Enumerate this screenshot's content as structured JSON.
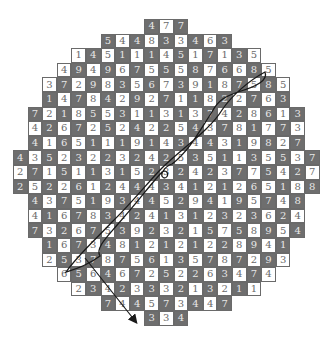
{
  "puzzle": {
    "type": "hexagonal-number-grid-path",
    "rows": [
      [
        4,
        7,
        7
      ],
      [
        5,
        4,
        4,
        8,
        3,
        3,
        4,
        6,
        3
      ],
      [
        1,
        4,
        5,
        1,
        1,
        1,
        4,
        5,
        1,
        7,
        1,
        3,
        5
      ],
      [
        4,
        9,
        4,
        9,
        6,
        7,
        5,
        5,
        5,
        8,
        7,
        6,
        6,
        8,
        5
      ],
      [
        3,
        7,
        2,
        9,
        8,
        3,
        5,
        6,
        7,
        3,
        9,
        1,
        8,
        7,
        5,
        8,
        5
      ],
      [
        1,
        4,
        7,
        8,
        4,
        2,
        9,
        2,
        7,
        1,
        1,
        8,
        2,
        2,
        7,
        6,
        3
      ],
      [
        7,
        2,
        1,
        8,
        5,
        5,
        3,
        1,
        1,
        3,
        1,
        3,
        7,
        4,
        2,
        8,
        6,
        1,
        3
      ],
      [
        4,
        2,
        6,
        7,
        2,
        5,
        2,
        4,
        2,
        2,
        5,
        4,
        3,
        7,
        8,
        1,
        7,
        7,
        3
      ],
      [
        4,
        1,
        6,
        5,
        1,
        1,
        1,
        9,
        1,
        4,
        3,
        4,
        4,
        3,
        1,
        9,
        8,
        2,
        7
      ],
      [
        4,
        3,
        5,
        2,
        3,
        2,
        2,
        3,
        2,
        4,
        2,
        5,
        3,
        5,
        1,
        1,
        3,
        5,
        5,
        3,
        7
      ],
      [
        2,
        7,
        1,
        5,
        1,
        1,
        3,
        1,
        5,
        2,
        3,
        2,
        4,
        2,
        3,
        7,
        7,
        5,
        4,
        2,
        7
      ],
      [
        2,
        5,
        2,
        2,
        6,
        1,
        2,
        4,
        4,
        4,
        3,
        4,
        1,
        2,
        1,
        2,
        6,
        5,
        1,
        8,
        8
      ],
      [
        4,
        3,
        7,
        5,
        1,
        9,
        3,
        4,
        4,
        5,
        2,
        9,
        4,
        1,
        9,
        5,
        7,
        4,
        8
      ],
      [
        4,
        1,
        6,
        7,
        8,
        3,
        4,
        2,
        4,
        1,
        3,
        1,
        2,
        3,
        2,
        3,
        6,
        2,
        4
      ],
      [
        7,
        3,
        2,
        6,
        7,
        5,
        3,
        9,
        2,
        3,
        2,
        1,
        5,
        7,
        5,
        8,
        9,
        5,
        4
      ],
      [
        1,
        6,
        7,
        3,
        4,
        8,
        1,
        2,
        1,
        2,
        1,
        2,
        2,
        8,
        9,
        4,
        1
      ],
      [
        2,
        5,
        3,
        7,
        8,
        7,
        5,
        6,
        1,
        3,
        5,
        7,
        8,
        7,
        2,
        9,
        3
      ],
      [
        6,
        5,
        6,
        4,
        6,
        7,
        2,
        5,
        2,
        2,
        6,
        3,
        4,
        7,
        4
      ],
      [
        2,
        3,
        4,
        2,
        3,
        3,
        3,
        2,
        1,
        3,
        2,
        1,
        1
      ],
      [
        7,
        4,
        4,
        5,
        7,
        3,
        4,
        4,
        7
      ],
      [
        3,
        3,
        4
      ]
    ],
    "row_start_cols": [
      9,
      6,
      4,
      3,
      2,
      2,
      1,
      1,
      1,
      0,
      0,
      0,
      1,
      1,
      1,
      2,
      2,
      3,
      4,
      6,
      9
    ],
    "colors": {
      "dark": "#6e6e6e",
      "light": "#ffffff",
      "line": "#1a1a1a"
    },
    "path": {
      "loop": "M265,72 C250,80 232,95 222,110 C210,130 180,150 162,168 C150,180 130,205 112,222 C95,240 78,255 66,272 C80,268 92,262 100,256 C95,248 108,236 118,224 C135,205 150,185 162,172 C168,168 170,178 164,178 C158,176 165,166 172,164 C190,150 200,130 212,112 C218,100 226,96 238,92 C258,86 268,80 265,72 Z",
      "arrow_from": [
        85,
        258
      ],
      "arrow_to": [
        136,
        322
      ]
    }
  }
}
